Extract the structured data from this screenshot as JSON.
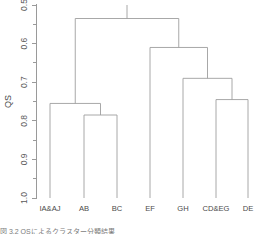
{
  "figure": {
    "kind": "dendrogram",
    "background_color": "#ffffff",
    "line_color": "#9e9e9e",
    "text_color": "#4a4a4a"
  },
  "axis": {
    "y_title": "QS",
    "y_tick_labels": [
      "0.5",
      "0.6",
      "0.7",
      "0.8",
      "0.9",
      "1.0"
    ],
    "y_tick_values": [
      0.5,
      0.6,
      0.7,
      0.8,
      0.9,
      1.0
    ],
    "y_minor_tick_values": [
      0.55,
      0.65,
      0.75,
      0.85,
      0.95
    ],
    "y_inverted": true
  },
  "caption": {
    "text": "図 3.2  QSによるクラスター分類結果"
  },
  "chart_data": {
    "type": "dendrogram",
    "title": "",
    "xlabel": "",
    "ylabel": "QS",
    "ylim": [
      0.5,
      1.0
    ],
    "y_inverted": true,
    "grid": false,
    "legend": "none",
    "leaves": [
      {
        "label": "IA&AJ",
        "x": 50
      },
      {
        "label": "AB",
        "x": 84
      },
      {
        "label": "BC",
        "x": 117
      },
      {
        "label": "EF",
        "x": 150
      },
      {
        "label": "GH",
        "x": 183
      },
      {
        "label": "CD&EG",
        "x": 216
      },
      {
        "label": "DE",
        "x": 248
      }
    ],
    "leaf_base": 1.0,
    "merges": [
      {
        "id": "m1",
        "members": [
          "AB",
          "BC"
        ],
        "height": 0.785,
        "x_left": 84,
        "x_right": 117,
        "x_center": 100.5
      },
      {
        "id": "m2",
        "members": [
          "IA&AJ",
          "m1"
        ],
        "height": 0.755,
        "x_left": 50,
        "x_right": 100.5,
        "x_center": 75.25
      },
      {
        "id": "m3",
        "members": [
          "CD&EG",
          "DE"
        ],
        "height": 0.745,
        "x_left": 216,
        "x_right": 248,
        "x_center": 232
      },
      {
        "id": "m4",
        "members": [
          "GH",
          "m3"
        ],
        "height": 0.69,
        "x_left": 183,
        "x_right": 232,
        "x_center": 207.5
      },
      {
        "id": "m5",
        "members": [
          "EF",
          "m4"
        ],
        "height": 0.61,
        "x_left": 150,
        "x_right": 207.5,
        "x_center": 178.75
      },
      {
        "id": "m6",
        "members": [
          "m2",
          "m5"
        ],
        "height": 0.535,
        "x_left": 75.25,
        "x_right": 178.75,
        "x_center": 127
      }
    ]
  }
}
